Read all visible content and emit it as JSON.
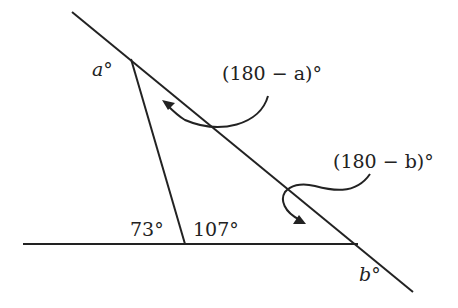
{
  "diagram": {
    "type": "geometry-angles",
    "labels": {
      "angle_a": "a°",
      "angle_b": "b°",
      "supp_a": "(180 − a)°",
      "supp_b": "(180 − b)°",
      "angle_73": "73°",
      "angle_107": "107°"
    },
    "colors": {
      "stroke": "#222222",
      "background": "#ffffff"
    }
  }
}
